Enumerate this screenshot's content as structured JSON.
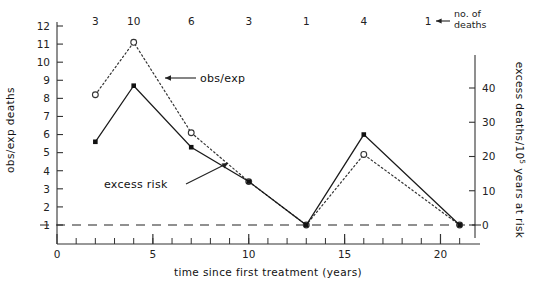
{
  "chart_data": {
    "type": "line",
    "title": "",
    "xlabel": "time since first treatment (years)",
    "ylabel": "obs/exp deaths",
    "y2label": "excess deaths/10⁵ years at risk",
    "xlim": [
      0,
      21.8
    ],
    "ylim": [
      0.3,
      12.4
    ],
    "y2lim": [
      -3.7,
      46
    ],
    "grid": false,
    "legend": "inline-annotations",
    "x_major_ticks": [
      0,
      5,
      10,
      15,
      20
    ],
    "x_major_tick_labels": [
      "0",
      "5",
      "10",
      "15",
      "20"
    ],
    "x_minor_tick_step": 1,
    "y_ticks": [
      1,
      2,
      3,
      4,
      5,
      6,
      7,
      8,
      9,
      10,
      11,
      12
    ],
    "y_tick_labels": [
      "1",
      "2",
      "3",
      "4",
      "5",
      "6",
      "7",
      "8",
      "9",
      "10",
      "11",
      "12"
    ],
    "y2_ticks": [
      0,
      10,
      20,
      30,
      40
    ],
    "y2_tick_labels": [
      "0",
      "10",
      "20",
      "30",
      "40"
    ],
    "reference_line": {
      "y": 1,
      "y2": 0,
      "style": "dashed"
    },
    "x": [
      2,
      4,
      7,
      10,
      13,
      16,
      21
    ],
    "series": [
      {
        "name": "obs/exp",
        "label": "obs/exp",
        "marker": "open-circle",
        "line": "dotted",
        "axis": "left",
        "values": [
          8.2,
          11.1,
          6.1,
          3.4,
          1.0,
          4.9,
          1.0
        ]
      },
      {
        "name": "excess risk",
        "label": "excess risk",
        "marker": "filled-square",
        "line": "solid",
        "axis": "left",
        "values": [
          5.6,
          8.7,
          5.3,
          3.4,
          1.0,
          6.0,
          1.0
        ]
      }
    ],
    "annotations": {
      "deaths_row_label": "no. of",
      "deaths_row_label2": "deaths",
      "deaths_counts": [
        "3",
        "10",
        "6",
        "3",
        "1",
        "4"
      ],
      "deaths_legend_value": "1",
      "obs_exp_callout": "obs/exp",
      "excess_risk_callout": "excess risk"
    },
    "y2_axis_parts": {
      "pre": "excess deaths/10",
      "sup": "5",
      "post": " years at risk"
    }
  },
  "colors": {
    "ink": "#1a1a1a",
    "axis": "#333333",
    "background": "#ffffff"
  }
}
